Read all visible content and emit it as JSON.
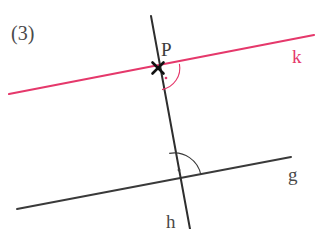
{
  "figure": {
    "index_label": "(3)",
    "background_color": "#ffffff",
    "width": 322,
    "height": 229,
    "colors": {
      "line_k": "#e5386b",
      "line_g": "#3a3a3a",
      "line_h": "#2e2e2e",
      "text_dark": "#4a4a4a",
      "arc_pink": "#e5386b",
      "arc_dark": "#3a3a3a"
    },
    "lines": [
      {
        "name": "k",
        "label": "k",
        "color": "#e5386b",
        "stroke_width": 2.2,
        "x1": 9,
        "y1": 94,
        "x2": 314,
        "y2": 35,
        "label_x": 292,
        "label_y": 47
      },
      {
        "name": "g",
        "label": "g",
        "color": "#3a3a3a",
        "stroke_width": 2.0,
        "x1": 17,
        "y1": 209,
        "x2": 291,
        "y2": 157,
        "label_x": 288,
        "label_y": 165
      },
      {
        "name": "h",
        "label": "h",
        "color": "#2e2e2e",
        "stroke_width": 2.0,
        "x1": 151,
        "y1": 16,
        "x2": 190,
        "y2": 229,
        "label_x": 166,
        "label_y": 212
      }
    ],
    "points": [
      {
        "name": "P",
        "label": "P",
        "marker": "cross-x",
        "x": 158,
        "y": 68,
        "label_x": 161,
        "label_y": 40
      }
    ],
    "right_angle_markers": [
      {
        "name": "right-angle-at-p",
        "at_point": "P",
        "color": "#e5386b",
        "center_x": 158,
        "center_y": 68,
        "radius": 22,
        "dot_x": 166,
        "dot_y": 78,
        "arc_path": "M 179.4 63.8 A 22 22 0 0 1 162.0 89.6"
      },
      {
        "name": "right-angle-at-gh",
        "at_point": "intersection-g-h",
        "color": "#3a3a3a",
        "center_x": 174,
        "center_y": 180,
        "radius": 27,
        "dot_x": 179,
        "dot_y": 170,
        "arc_path": "M 169.2 153.4 A 27 27 0 0 1 200.9 175.0"
      }
    ]
  }
}
